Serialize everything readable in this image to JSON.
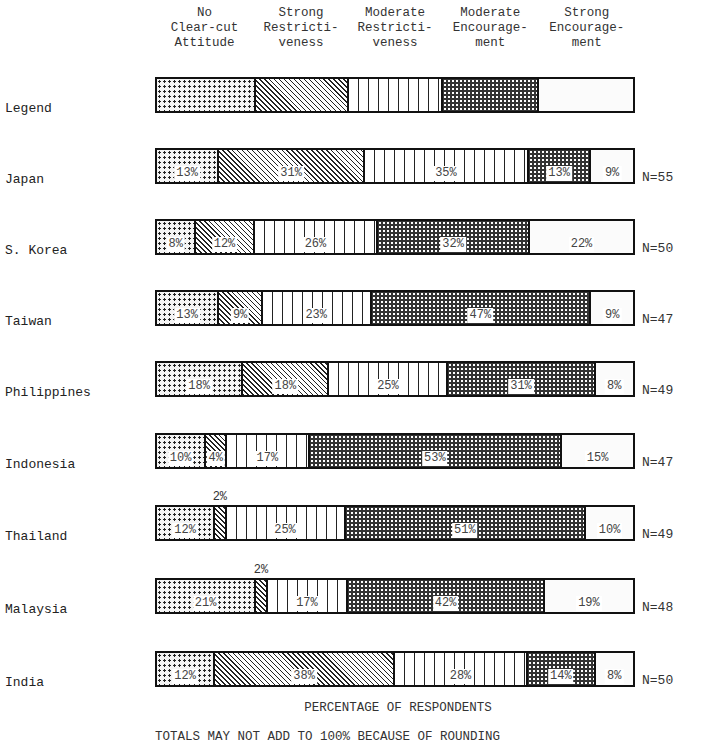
{
  "chart_data": {
    "type": "bar",
    "orientation": "horizontal-stacked-100",
    "title": "",
    "xlabel": "PERCENTAGE OF RESPONDENTS",
    "footnote": "TOTALS MAY NOT ADD TO 100% BECAUSE OF ROUNDING",
    "legend": [
      {
        "key": "no_clear",
        "label": "No Clear-cut Attitude",
        "lines": [
          "No",
          "Clear-cut",
          "Attitude"
        ],
        "pattern": "dots"
      },
      {
        "key": "strong_restr",
        "label": "Strong Restrictiveness",
        "lines": [
          "Strong",
          "Restricti-",
          "veness"
        ],
        "pattern": "diagonal"
      },
      {
        "key": "mod_restr",
        "label": "Moderate Restrictiveness",
        "lines": [
          "Moderate",
          "Restricti-",
          "veness"
        ],
        "pattern": "vertical"
      },
      {
        "key": "mod_enc",
        "label": "Moderate Encouragement",
        "lines": [
          "Moderate",
          "Encourage-",
          "ment"
        ],
        "pattern": "dense-dots"
      },
      {
        "key": "strong_enc",
        "label": "Strong Encouragement",
        "lines": [
          "Strong",
          "Encourage-",
          "ment"
        ],
        "pattern": "white"
      }
    ],
    "legend_row_label": "Legend",
    "categories": [
      "Japan",
      "S. Korea",
      "Taiwan",
      "Philippines",
      "Indonesia",
      "Thailand",
      "Malaysia",
      "India"
    ],
    "n": [
      "N=55",
      "N=50",
      "N=47",
      "N=49",
      "N=47",
      "N=49",
      "N=48",
      "N=50"
    ],
    "series": [
      {
        "name": "No Clear-cut Attitude",
        "values": [
          13,
          8,
          13,
          18,
          10,
          12,
          21,
          12
        ]
      },
      {
        "name": "Strong Restrictiveness",
        "values": [
          31,
          12,
          9,
          18,
          4,
          2,
          2,
          38
        ]
      },
      {
        "name": "Moderate Restrictiveness",
        "values": [
          35,
          26,
          23,
          25,
          17,
          25,
          17,
          28
        ]
      },
      {
        "name": "Moderate Encouragement",
        "values": [
          13,
          32,
          47,
          31,
          53,
          51,
          42,
          14
        ]
      },
      {
        "name": "Strong Encouragement",
        "values": [
          9,
          22,
          9,
          8,
          15,
          10,
          19,
          8
        ]
      }
    ],
    "xlim": [
      0,
      100
    ],
    "grid": false,
    "legend_position": "top"
  }
}
